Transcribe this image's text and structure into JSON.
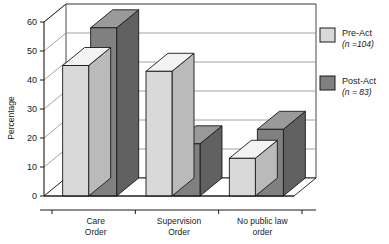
{
  "chart_data": {
    "type": "bar",
    "title": "",
    "xlabel": "",
    "ylabel": "Percentage",
    "categories": [
      "Care Order",
      "Supervision Order",
      "No public law order"
    ],
    "category_lines": [
      [
        "Care",
        "Order"
      ],
      [
        "Supervision",
        "Order"
      ],
      [
        "No public law",
        "order"
      ]
    ],
    "series": [
      {
        "name": "Pre-Act",
        "sublabel": "(n =104)",
        "color": "#d9d9d9",
        "values": [
          45,
          43,
          13
        ]
      },
      {
        "name": "Post-Act",
        "sublabel": "(n = 83)",
        "color": "#808080",
        "values": [
          58,
          18,
          23
        ]
      }
    ],
    "ylim": [
      0,
      60
    ],
    "yticks": [
      0,
      10,
      20,
      30,
      40,
      50,
      60
    ],
    "ytick_labels": [
      "0",
      "10",
      "20",
      "30",
      "40",
      "50",
      "60"
    ],
    "grid": true,
    "grid_axis": "y",
    "legend_position": "right",
    "three_d": true,
    "outline_color": "#1a1a1a",
    "grid_color": "#8c8c8c"
  }
}
